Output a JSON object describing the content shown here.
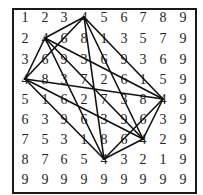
{
  "grid": {
    "rows": [
      [
        1,
        2,
        3,
        4,
        5,
        6,
        7,
        8,
        9
      ],
      [
        2,
        4,
        6,
        8,
        1,
        3,
        5,
        7,
        9
      ],
      [
        3,
        6,
        9,
        3,
        6,
        9,
        3,
        6,
        9
      ],
      [
        4,
        8,
        3,
        7,
        2,
        6,
        1,
        5,
        9
      ],
      [
        5,
        1,
        6,
        2,
        7,
        3,
        8,
        4,
        9
      ],
      [
        6,
        3,
        9,
        6,
        3,
        9,
        6,
        3,
        9
      ],
      [
        7,
        5,
        3,
        1,
        8,
        6,
        4,
        2,
        9
      ],
      [
        8,
        7,
        6,
        5,
        4,
        3,
        2,
        1,
        9
      ],
      [
        9,
        9,
        9,
        9,
        9,
        9,
        9,
        9,
        9
      ]
    ],
    "col_x": [
      25,
      45,
      64,
      84,
      104,
      124,
      143,
      163,
      183
    ],
    "row_y": [
      18,
      39,
      60,
      80,
      100,
      120,
      140,
      160,
      180
    ]
  },
  "graph": {
    "highlight_value": 4,
    "nodes": [
      [
        0,
        3
      ],
      [
        1,
        1
      ],
      [
        3,
        0
      ],
      [
        4,
        7
      ],
      [
        6,
        6
      ],
      [
        7,
        4
      ]
    ],
    "edges": "complete",
    "stroke_color": "#111111"
  }
}
